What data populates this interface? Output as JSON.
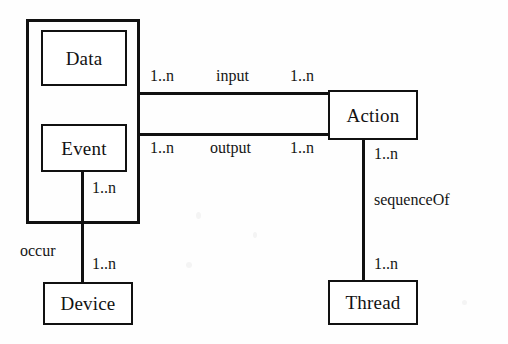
{
  "diagram": {
    "type": "entity-relationship",
    "background_color": "#fefefe",
    "stroke_color": "#111111",
    "entities": [
      {
        "id": "data",
        "label": "Data",
        "x": 41,
        "y": 30,
        "w": 86,
        "h": 56
      },
      {
        "id": "event",
        "label": "Event",
        "x": 41,
        "y": 124,
        "w": 86,
        "h": 48
      },
      {
        "id": "action",
        "label": "Action",
        "x": 328,
        "y": 90,
        "w": 90,
        "h": 50
      },
      {
        "id": "device",
        "label": "Device",
        "x": 43,
        "y": 282,
        "w": 90,
        "h": 43
      },
      {
        "id": "thread",
        "label": "Thread",
        "x": 328,
        "y": 280,
        "w": 90,
        "h": 45
      }
    ],
    "group": {
      "id": "data-event-group",
      "x": 26,
      "y": 19,
      "w": 114,
      "h": 205
    },
    "relationships": [
      {
        "id": "input",
        "label": "input",
        "from": "data",
        "to": "action",
        "from_cardinality": "1..n",
        "to_cardinality": "1..n",
        "orientation": "horizontal"
      },
      {
        "id": "output",
        "label": "output",
        "from": "event",
        "to": "action",
        "from_cardinality": "1..n",
        "to_cardinality": "1..n",
        "orientation": "horizontal"
      },
      {
        "id": "sequenceOf",
        "label": "sequenceOf",
        "from": "action",
        "to": "thread",
        "from_cardinality": "1..n",
        "to_cardinality": "1..n",
        "orientation": "vertical"
      },
      {
        "id": "occur",
        "label": "occur",
        "from": "event",
        "to": "device",
        "from_cardinality": "1..n",
        "to_cardinality": "1..n",
        "orientation": "vertical"
      }
    ]
  }
}
